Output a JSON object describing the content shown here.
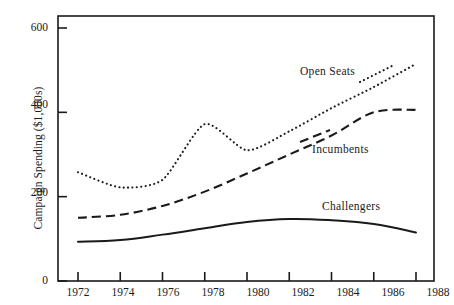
{
  "figure": {
    "width": 444,
    "height": 305,
    "background": "#ffffff",
    "ink_color": "#1a1a1a",
    "scan_artifact_text": "·  ·   ·   · · ·  ·  · ·"
  },
  "axes": {
    "y_title": "Campaign Spending ($1,000s)",
    "y_ticks": [
      0,
      200,
      400,
      600
    ],
    "y_tick_labels": [
      "0",
      "200",
      "400",
      "600"
    ],
    "x_ticks": [
      1972,
      1974,
      1976,
      1978,
      1980,
      1982,
      1984,
      1986,
      1988
    ],
    "x_tick_labels": [
      "1972",
      "1974",
      "1976",
      "1978",
      "1980",
      "1982",
      "1984",
      "1986",
      "1988"
    ],
    "frame": "box",
    "grid": false
  },
  "series_labels": {
    "open_seats": "Open Seats",
    "incumbents": "Incumbents",
    "challengers": "Challengers"
  },
  "chart_data": {
    "type": "line",
    "title": "",
    "subtitle": "",
    "xlabel": "",
    "ylabel": "Campaign Spending ($1,000s)",
    "xlim": [
      1971,
      1989
    ],
    "ylim": [
      0,
      620
    ],
    "grid": false,
    "legend_position": "inline-annotations",
    "x": [
      1972,
      1974,
      1976,
      1978,
      1980,
      1982,
      1984,
      1986,
      1988
    ],
    "series": [
      {
        "name": "Open Seats",
        "style": "dotted",
        "values": [
          258,
          222,
          240,
          372,
          310,
          355,
          410,
          460,
          515
        ]
      },
      {
        "name": "Incumbents",
        "style": "dashed",
        "values": [
          150,
          157,
          178,
          212,
          255,
          300,
          345,
          400,
          406
        ]
      },
      {
        "name": "Challengers",
        "style": "solid",
        "values": [
          93,
          97,
          110,
          125,
          140,
          147,
          144,
          135,
          115
        ]
      }
    ]
  }
}
